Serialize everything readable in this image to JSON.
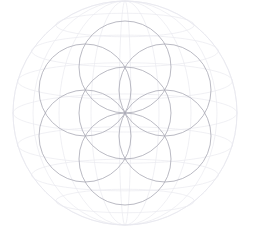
{
  "figure": {
    "name": "Flower of Life",
    "alt_name": "Seed of Life",
    "type": "sacred-geometry-line-drawing",
    "background_color": "#ffffff",
    "canvas": {
      "width": 254,
      "height": 241
    }
  },
  "chart_data": {
    "type": "scatter",
    "xlabel": "",
    "ylabel": "",
    "grid": false,
    "legend": null,
    "xlim": [
      0,
      254
    ],
    "ylim": [
      0,
      241
    ],
    "geometry": {
      "center": {
        "x": 125,
        "y": 113
      },
      "petal_radius": 46,
      "ring_count": 6,
      "circle_count": 7,
      "start_angle_deg": -90,
      "angle_step_deg": 60
    },
    "series": [
      {
        "name": "seed-circles",
        "stroke": "#a9a9b4",
        "stroke_width": 0.85,
        "opacity": 0.95,
        "points": [
          {
            "label": "center",
            "cx": 125,
            "cy": 113,
            "r": 46
          },
          {
            "label": "top",
            "cx": 125,
            "cy": 67,
            "r": 46
          },
          {
            "label": "upper-right",
            "cx": 165,
            "cy": 90,
            "r": 46
          },
          {
            "label": "lower-right",
            "cx": 165,
            "cy": 136,
            "r": 46
          },
          {
            "label": "bottom",
            "cx": 125,
            "cy": 159,
            "r": 46
          },
          {
            "label": "lower-left",
            "cx": 85,
            "cy": 136,
            "r": 46
          },
          {
            "label": "upper-left",
            "cx": 85,
            "cy": 90,
            "r": 46
          }
        ]
      },
      {
        "name": "sphere-wireframe",
        "stroke": "#e9e9ef",
        "stroke_width": 0.7,
        "opacity": 1,
        "outline": {
          "cx": 125,
          "cy": 113,
          "r": 112
        },
        "longitude_rx": [
          112,
          92,
          66,
          34,
          6
        ],
        "latitude_offsets": [
          -88,
          -62,
          -32,
          0,
          32,
          62,
          88
        ]
      }
    ],
    "annotations": []
  },
  "palette": {
    "circle_stroke": "#a9a9b4",
    "sphere_stroke": "#e9e9ef",
    "background": "#ffffff"
  }
}
